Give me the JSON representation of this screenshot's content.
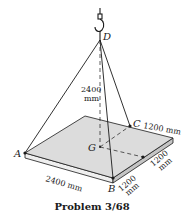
{
  "diagram": {
    "caption": "Problem 3/68",
    "points": {
      "A": "A",
      "B": "B",
      "C": "C",
      "D": "D",
      "G": "G"
    },
    "dimensions": {
      "height": [
        "2400",
        "mm"
      ],
      "length_AB": "2400 mm",
      "length_C": "1200 mm",
      "side_1": [
        "1200",
        "mm"
      ],
      "side_2": [
        "1200",
        "mm"
      ]
    },
    "colors": {
      "plate_top": "#dcdcdc",
      "plate_side": "#c4c4c4",
      "line": "#1a1a1a"
    }
  }
}
